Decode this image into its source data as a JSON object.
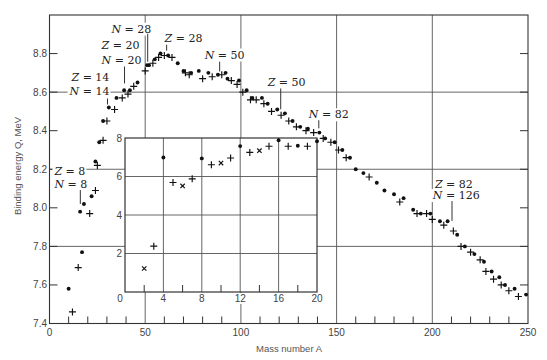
{
  "chart_data": {
    "type": "scatter",
    "title": "",
    "xlabel": "Mass number A",
    "ylabel": "Binding energy Q, MeV",
    "xlim": [
      0,
      250
    ],
    "ylim": [
      7.4,
      9.0
    ],
    "x_ticks": [
      0,
      50,
      100,
      150,
      200,
      250
    ],
    "x_minor_ticks": [
      10,
      20,
      30,
      40,
      60,
      70,
      80,
      90,
      110,
      120,
      130,
      140,
      160,
      170,
      180,
      190,
      210,
      220,
      230,
      240
    ],
    "y_ticks": [
      7.4,
      7.6,
      7.8,
      8.0,
      8.2,
      8.4,
      8.6,
      8.8
    ],
    "grid": {
      "on": true,
      "x": [
        50,
        100,
        150,
        200
      ],
      "y": [
        7.8,
        8.2,
        8.6
      ]
    },
    "legend": null,
    "series": [
      {
        "name": "filled-circle points",
        "marker": "dot",
        "points": [
          [
            10,
            7.58
          ],
          [
            16,
            7.98
          ],
          [
            17,
            7.77
          ],
          [
            18,
            8.02
          ],
          [
            22,
            8.06
          ],
          [
            24,
            8.24
          ],
          [
            26,
            8.34
          ],
          [
            28,
            8.45
          ],
          [
            31,
            8.52
          ],
          [
            35,
            8.57
          ],
          [
            39,
            8.61
          ],
          [
            42,
            8.61
          ],
          [
            46,
            8.65
          ],
          [
            51,
            8.74
          ],
          [
            52,
            8.74
          ],
          [
            55,
            8.77
          ],
          [
            58,
            8.8
          ],
          [
            62,
            8.79
          ],
          [
            67,
            8.75
          ],
          [
            70,
            8.71
          ],
          [
            74,
            8.7
          ],
          [
            78,
            8.71
          ],
          [
            83,
            8.7
          ],
          [
            88,
            8.69
          ],
          [
            92,
            8.7
          ],
          [
            93,
            8.67
          ],
          [
            99,
            8.66
          ],
          [
            103,
            8.61
          ],
          [
            106,
            8.57
          ],
          [
            111,
            8.57
          ],
          [
            114,
            8.54
          ],
          [
            119,
            8.51
          ],
          [
            123,
            8.49
          ],
          [
            127,
            8.45
          ],
          [
            131,
            8.42
          ],
          [
            135,
            8.41
          ],
          [
            141,
            8.39
          ],
          [
            144,
            8.36
          ],
          [
            149,
            8.34
          ],
          [
            153,
            8.3
          ],
          [
            157,
            8.26
          ],
          [
            160,
            8.2
          ],
          [
            164,
            8.18
          ],
          [
            171,
            8.13
          ],
          [
            175,
            8.09
          ],
          [
            180,
            8.07
          ],
          [
            185,
            8.05
          ],
          [
            190,
            7.99
          ],
          [
            194,
            7.97
          ],
          [
            199,
            7.97
          ],
          [
            204,
            7.93
          ],
          [
            208,
            7.93
          ],
          [
            213,
            7.86
          ],
          [
            217,
            7.8
          ],
          [
            222,
            7.76
          ],
          [
            227,
            7.72
          ],
          [
            231,
            7.67
          ],
          [
            235,
            7.64
          ],
          [
            238,
            7.6
          ],
          [
            243,
            7.58
          ],
          [
            249,
            7.55
          ]
        ]
      },
      {
        "name": "plus points",
        "marker": "plus",
        "points": [
          [
            12,
            7.46
          ],
          [
            15,
            7.69
          ],
          [
            21,
            7.97
          ],
          [
            24,
            8.09
          ],
          [
            25,
            8.22
          ],
          [
            28,
            8.35
          ],
          [
            30,
            8.45
          ],
          [
            34,
            8.51
          ],
          [
            38,
            8.57
          ],
          [
            41,
            8.59
          ],
          [
            44,
            8.63
          ],
          [
            50,
            8.71
          ],
          [
            54,
            8.75
          ],
          [
            57,
            8.78
          ],
          [
            60,
            8.79
          ],
          [
            64,
            8.78
          ],
          [
            71,
            8.7
          ],
          [
            73,
            8.69
          ],
          [
            80,
            8.67
          ],
          [
            85,
            8.68
          ],
          [
            90,
            8.69
          ],
          [
            95,
            8.66
          ],
          [
            98,
            8.64
          ],
          [
            101,
            8.6
          ],
          [
            105,
            8.56
          ],
          [
            108,
            8.56
          ],
          [
            112,
            8.54
          ],
          [
            116,
            8.5
          ],
          [
            121,
            8.48
          ],
          [
            125,
            8.45
          ],
          [
            129,
            8.42
          ],
          [
            134,
            8.4
          ],
          [
            138,
            8.39
          ],
          [
            143,
            8.36
          ],
          [
            147,
            8.34
          ],
          [
            151,
            8.3
          ],
          [
            155,
            8.26
          ],
          [
            167,
            8.16
          ],
          [
            183,
            8.03
          ],
          [
            192,
            7.97
          ],
          [
            197,
            7.97
          ],
          [
            200,
            7.94
          ],
          [
            206,
            7.91
          ],
          [
            211,
            7.88
          ],
          [
            215,
            7.8
          ],
          [
            220,
            7.77
          ],
          [
            225,
            7.73
          ],
          [
            228,
            7.67
          ],
          [
            232,
            7.63
          ],
          [
            236,
            7.6
          ],
          [
            240,
            7.57
          ],
          [
            245,
            7.54
          ]
        ]
      }
    ],
    "annotations": [
      {
        "lines": [
          {
            "text": "Z = 8",
            "A": 2.6,
            "Q": 8.19
          },
          {
            "text": "N = 8",
            "A": 2.6,
            "Q": 8.123
          }
        ],
        "leader": {
          "A": 16.1,
          "Q_top": 8.092,
          "Q_bottom": 8.02
        }
      },
      {
        "lines": [
          {
            "text": "Z = 14",
            "A": 11.5,
            "Q": 8.681
          },
          {
            "text": "N = 14",
            "A": 10.5,
            "Q": 8.604
          }
        ],
        "leader": {
          "A": 30.3,
          "Q_top": 8.567,
          "Q_bottom": 8.536
        }
      },
      {
        "lines": [
          {
            "text": "Z = 20",
            "A": 27.2,
            "Q": 8.846
          },
          {
            "text": "N = 20",
            "A": 27.2,
            "Q": 8.769
          }
        ],
        "leader": {
          "A": 39.2,
          "Q_top": 8.733,
          "Q_bottom": 8.645
        }
      },
      {
        "lines": [
          {
            "text": "N = 28",
            "A": 32.4,
            "Q": 8.929
          }
        ],
        "leader": {
          "A": 51.3,
          "Q_top": 8.903,
          "Q_bottom": 8.758
        }
      },
      {
        "lines": [
          {
            "text": "Z = 28",
            "A": 60.1,
            "Q": 8.882
          }
        ],
        "leader": {
          "A": 61.2,
          "Q_top": 8.846,
          "Q_bottom": 8.815
        }
      },
      {
        "lines": [
          {
            "text": "N = 50",
            "A": 81.1,
            "Q": 8.795
          }
        ],
        "leader": {
          "A": 88.9,
          "Q_top": 8.758,
          "Q_bottom": 8.707
        }
      },
      {
        "lines": [
          {
            "text": "Z = 50",
            "A": 114.0,
            "Q": 8.65
          }
        ],
        "leader": {
          "A": 120.8,
          "Q_top": 8.619,
          "Q_bottom": 8.511
        }
      },
      {
        "lines": [
          {
            "text": "N = 82",
            "A": 135.5,
            "Q": 8.485
          }
        ],
        "leader": {
          "A": 140.7,
          "Q_top": 8.454,
          "Q_bottom": 8.412
        }
      },
      {
        "lines": [
          {
            "text": "Z = 82",
            "A": 201.4,
            "Q": 8.123
          },
          {
            "text": "N = 126",
            "A": 200.3,
            "Q": 8.066
          }
        ],
        "leader": {
          "A": 210.3,
          "Q_top": 8.035,
          "Q_bottom": 7.932
        }
      }
    ],
    "inset": {
      "type": "scatter",
      "xlim": [
        0,
        20
      ],
      "ylim": [
        0,
        8
      ],
      "corner_label": "0",
      "x_tick_labels": [
        4,
        8,
        12,
        16,
        20
      ],
      "y_tick_labels": [
        2,
        4,
        6,
        8
      ],
      "x_minor_ticks": [
        2,
        6,
        10,
        14,
        18
      ],
      "grid": {
        "on": true,
        "x": [
          4,
          8,
          12,
          16
        ],
        "y": [
          2,
          4,
          6
        ]
      },
      "series": [
        {
          "name": "filled-circle points",
          "marker": "dot",
          "points": [
            [
              4,
              6.99
            ],
            [
              8,
              6.94
            ],
            [
              12,
              7.58
            ],
            [
              16,
              7.88
            ],
            [
              18,
              7.6
            ],
            [
              20,
              7.83
            ]
          ]
        },
        {
          "name": "plus points",
          "marker": "plus",
          "points": [
            [
              3,
              2.38
            ],
            [
              5,
              5.69
            ],
            [
              7,
              5.88
            ],
            [
              9,
              6.61
            ],
            [
              11,
              6.96
            ],
            [
              13,
              7.25
            ],
            [
              15,
              7.57
            ],
            [
              17,
              7.57
            ],
            [
              19,
              7.57
            ]
          ]
        },
        {
          "name": "cross points",
          "marker": "cross",
          "points": [
            [
              2,
              1.22
            ],
            [
              6,
              5.51
            ],
            [
              10,
              6.7
            ],
            [
              14,
              7.34
            ]
          ]
        }
      ]
    }
  }
}
